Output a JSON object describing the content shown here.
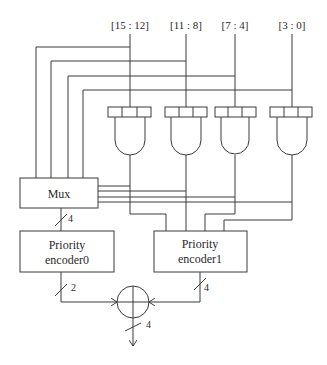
{
  "diagram": {
    "inputs": [
      {
        "label": "[15 : 12]",
        "x": 130
      },
      {
        "label": "[11 : 8]",
        "x": 186
      },
      {
        "label": "[7 : 4]",
        "x": 235
      },
      {
        "label": "[3 : 0]",
        "x": 292
      }
    ],
    "mux": {
      "label": "Mux",
      "bus_width": "4"
    },
    "encoder0": {
      "line1": "Priority",
      "line2": "encoder0",
      "bus_width": "2"
    },
    "encoder1": {
      "line1": "Priority",
      "line2": "encoder1",
      "bus_width": "4"
    },
    "adder": {
      "symbol": "adder-circle",
      "output_width": "4"
    },
    "colors": {
      "line": "#3a3a3a",
      "text": "#2a2a2a",
      "background": "#ffffff"
    }
  }
}
